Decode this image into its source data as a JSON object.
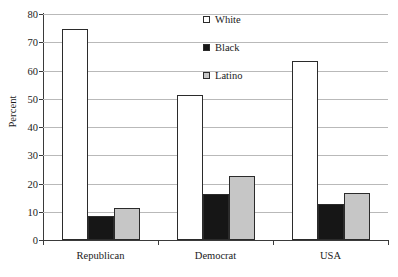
{
  "chart_data": {
    "type": "bar",
    "title": "",
    "subtitle": "",
    "xlabel": "",
    "ylabel": "Percent",
    "ylim": [
      0,
      80
    ],
    "yticks": [
      0,
      10,
      20,
      30,
      40,
      50,
      60,
      70,
      80
    ],
    "ytick_labels": [
      "0",
      "10",
      "20",
      "30",
      "40",
      "50",
      "60",
      "70",
      "80"
    ],
    "grid": true,
    "grid_axis": "y",
    "legend_position": "top-center-right",
    "categories": [
      "Republican",
      "Democrat",
      "USA"
    ],
    "series": [
      {
        "name": "White",
        "color": "#ffffff",
        "edge_color": "#2b2b2b",
        "values": [
          74.7,
          51.3,
          63.2
        ]
      },
      {
        "name": "Black",
        "color": "#161616",
        "edge_color": "#2b2b2b",
        "values": [
          8.5,
          16.2,
          12.8
        ]
      },
      {
        "name": "Latino",
        "color": "#c6c6c6",
        "edge_color": "#2b2b2b",
        "values": [
          11.2,
          22.5,
          16.6
        ]
      }
    ],
    "annotations": []
  },
  "legend": {
    "entries": [
      {
        "label": "White"
      },
      {
        "label": "Black"
      },
      {
        "label": "Latino"
      }
    ]
  },
  "axes": {
    "y_title": "Percent"
  }
}
